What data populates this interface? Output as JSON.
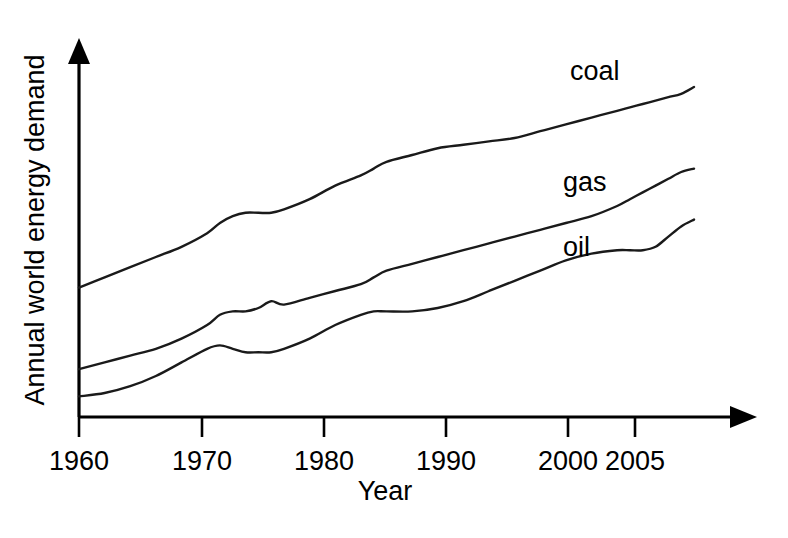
{
  "chart_data": {
    "type": "line",
    "title": "",
    "xlabel": "Year",
    "ylabel": "Annual world energy demand",
    "xlim": [
      1960,
      2008
    ],
    "ylim": [
      0,
      100
    ],
    "grid": false,
    "legend": "inline-right-of-curve",
    "xticks": [
      "1960",
      "1970",
      "1980",
      "1990",
      "2000",
      "2005"
    ],
    "xtick_values": [
      1960,
      1970,
      1980,
      1990,
      2000,
      2005
    ],
    "yticks": [],
    "x": [
      1960,
      1962,
      1964,
      1966,
      1968,
      1970,
      1971,
      1972,
      1973,
      1974,
      1975,
      1976,
      1978,
      1980,
      1982,
      1983,
      1984,
      1986,
      1988,
      1990,
      1992,
      1994,
      1996,
      1998,
      2000,
      2002,
      2003,
      2004,
      2005,
      2006,
      2007,
      2008
    ],
    "series": [
      {
        "name": "coal",
        "label": "coal",
        "color": "#1a1a1a",
        "values": [
          36,
          39,
          42,
          45,
          48,
          52,
          55,
          57,
          58,
          58,
          58,
          59,
          62,
          66,
          69,
          71,
          73,
          75,
          77,
          78,
          79,
          80,
          82,
          84,
          86,
          88,
          89,
          90,
          91,
          92,
          93,
          95
        ]
      },
      {
        "name": "gas",
        "label": "gas",
        "color": "#1a1a1a",
        "values": [
          12,
          14,
          16,
          18,
          21,
          25,
          28,
          29,
          29,
          30,
          32,
          31,
          33,
          35,
          37,
          39,
          41,
          43,
          45,
          47,
          49,
          51,
          53,
          55,
          57,
          60,
          62,
          64,
          66,
          68,
          70,
          71
        ]
      },
      {
        "name": "oil",
        "label": "oil",
        "color": "#1a1a1a",
        "values": [
          4,
          5,
          7,
          10,
          14,
          18,
          19,
          18,
          17,
          17,
          17,
          18,
          21,
          25,
          28,
          29,
          29,
          29,
          30,
          32,
          35,
          38,
          41,
          44,
          46,
          47,
          47,
          47,
          48,
          51,
          54,
          56
        ]
      }
    ],
    "annotations": [
      {
        "text": "coal",
        "series": "coal"
      },
      {
        "text": "gas",
        "series": "gas"
      },
      {
        "text": "oil",
        "series": "oil"
      }
    ]
  },
  "axes": {
    "x_title": "Year",
    "y_title": "Annual world energy demand"
  }
}
